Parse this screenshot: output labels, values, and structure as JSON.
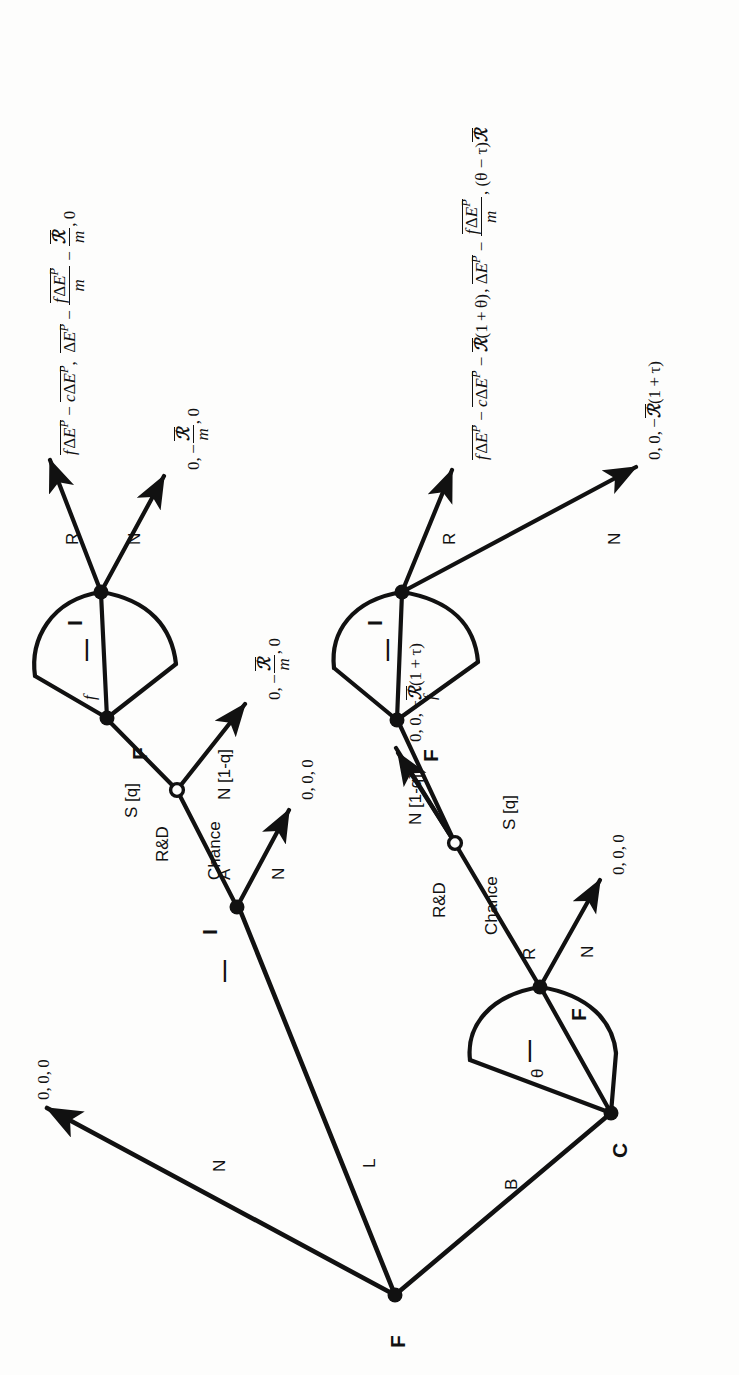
{
  "figure": {
    "kind": "extensive-form game tree",
    "orientation": "rotated 90 degrees counter-clockwise on the page",
    "background_color": "#fdfdfc",
    "ink_color": "#111111"
  },
  "nodes": [
    {
      "id": "root",
      "label": "F",
      "type": "decision",
      "filled": true
    },
    {
      "id": "i_upper",
      "label": "I",
      "type": "decision",
      "filled": true
    },
    {
      "id": "chance_u",
      "label": "",
      "type": "chance",
      "filled": false
    },
    {
      "id": "f_upper",
      "label": "F",
      "type": "decision",
      "filled": true
    },
    {
      "id": "i_top",
      "label": "I",
      "type": "decision",
      "filled": true
    },
    {
      "id": "c_lower",
      "label": "C",
      "type": "decision",
      "filled": true
    },
    {
      "id": "f_lower",
      "label": "F",
      "type": "decision",
      "filled": true
    },
    {
      "id": "chance_l",
      "label": "",
      "type": "chance",
      "filled": false
    },
    {
      "id": "f_lower2",
      "label": "F",
      "type": "decision",
      "filled": true
    },
    {
      "id": "i_lower",
      "label": "I",
      "type": "decision",
      "filled": true
    }
  ],
  "edge_labels": {
    "root_n": "N",
    "root_l": "L",
    "root_b": "B",
    "i_upper_a": "A",
    "i_upper_n": "N",
    "chance_rd": "R&D",
    "chance_word": "Chance",
    "chance_s": "S [q]",
    "chance_n": "N [1-q]",
    "f_upper_f": "f",
    "i_top_r": "R",
    "i_top_n": "N",
    "c_theta": "θ",
    "f_lower_r": "R",
    "f_lower_n": "N",
    "chance_l_rd": "R&D",
    "chance_l_word": "Chance",
    "chance_l_s": "S [q]",
    "chance_l_n": "N [1-q]",
    "f_lower2_f": "f",
    "i_lower_r": "R",
    "i_lower_n": "N"
  },
  "info_set_marker": "—",
  "payoffs": {
    "root_n": {
      "plain": "0,0,0"
    },
    "i_upper_n": {
      "plain": "0,0,0"
    },
    "chance_u_n": {
      "plain": "0,−R̄/m,0"
    },
    "i_top_r": {
      "plain": "fΔEᴾ − cΔEᴾ, ΔEᴾ − fΔEᴾ/m − R̄/m, 0"
    },
    "i_top_n": {
      "plain": "0,−R̄/m,0"
    },
    "f_lower_n": {
      "plain": "0,0,0"
    },
    "chance_l_n": {
      "plain": "0,0,−R̄(1+τ)"
    },
    "i_lower_r": {
      "plain": "fΔEᴾ − cΔEᴾ − R̄(1+θ), ΔEᴾ − fΔEᴾ/m, (θ−τ)R̄"
    },
    "i_lower_n": {
      "plain": "0,0,−R̄(1+τ)"
    }
  }
}
